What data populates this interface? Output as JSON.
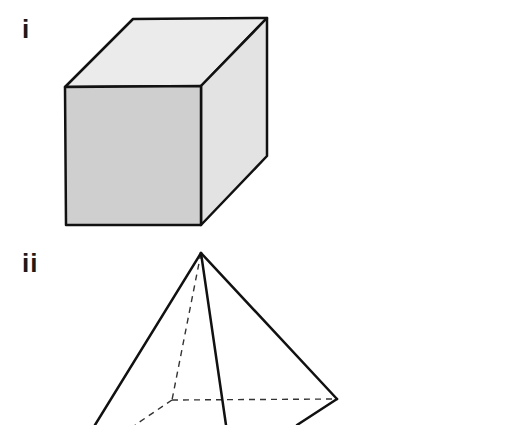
{
  "figures": [
    {
      "label": "i",
      "shape": "cube",
      "colors": {
        "front_face": "#cfcfcf",
        "side_face": "#e3e3e3",
        "top_face": "#ebebeb",
        "edge": "#111111"
      },
      "vertices": {
        "front_top_left": [
          65,
          87
        ],
        "front_top_right": [
          201,
          86
        ],
        "front_bottom_left": [
          66,
          225
        ],
        "front_bottom_right": [
          201,
          225
        ],
        "back_top_left": [
          133,
          19
        ],
        "back_top_right": [
          267,
          18
        ],
        "back_bottom_right": [
          267,
          156
        ]
      }
    },
    {
      "label": "ii",
      "shape": "square-based pyramid",
      "colors": {
        "edge": "#111111",
        "hidden_edge": "#333333"
      },
      "vertices": {
        "apex": [
          201,
          253
        ],
        "base_back_left": [
          172,
          400
        ],
        "base_back_right": [
          337,
          399
        ]
      },
      "hidden_edges": [
        "apex-to-back-left",
        "back-left-to-back-right",
        "back-left-to-front-left"
      ]
    }
  ]
}
